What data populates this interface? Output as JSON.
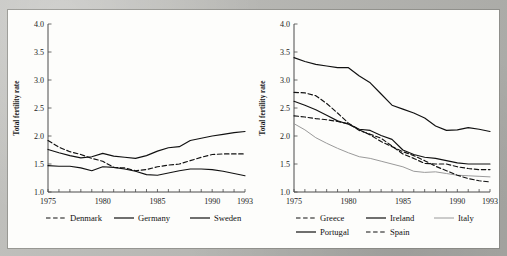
{
  "figure": {
    "background_color": "#b8b8b4",
    "panel_color": "#fdfdfb",
    "ink_color": "#1a1a1a"
  },
  "chart_data": [
    {
      "id": "northern-europe",
      "type": "line",
      "title": "",
      "xlabel": "",
      "ylabel": "Total fertility rate",
      "xlim": [
        1975,
        1993
      ],
      "ylim": [
        1.0,
        4.0
      ],
      "yticks": [
        "1.0",
        "1.5",
        "2.0",
        "2.5",
        "3.0",
        "3.5",
        "4.0"
      ],
      "ytick_values": [
        1.0,
        1.5,
        2.0,
        2.5,
        3.0,
        3.5,
        4.0
      ],
      "xticks": [
        "1975",
        "1980",
        "1985",
        "1990",
        "1993"
      ],
      "xtick_values": [
        1975,
        1980,
        1985,
        1990,
        1993
      ],
      "minor_xticks_every": 1,
      "grid": false,
      "legend_position": "below",
      "x": [
        1975,
        1976,
        1977,
        1978,
        1979,
        1980,
        1981,
        1982,
        1983,
        1984,
        1985,
        1986,
        1987,
        1988,
        1989,
        1990,
        1991,
        1992,
        1993
      ],
      "series": [
        {
          "name": "Denmark",
          "style": "dashed",
          "color": "#111111",
          "values": [
            1.92,
            1.8,
            1.72,
            1.67,
            1.6,
            1.55,
            1.44,
            1.43,
            1.38,
            1.4,
            1.45,
            1.48,
            1.5,
            1.56,
            1.62,
            1.67,
            1.68,
            1.68,
            1.68
          ]
        },
        {
          "name": "Germany",
          "style": "solid",
          "color": "#111111",
          "values": [
            1.47,
            1.46,
            1.46,
            1.43,
            1.38,
            1.45,
            1.44,
            1.41,
            1.37,
            1.31,
            1.3,
            1.34,
            1.38,
            1.41,
            1.41,
            1.4,
            1.37,
            1.33,
            1.29
          ]
        },
        {
          "name": "Sweden",
          "style": "solid",
          "color": "#111111",
          "values": [
            1.76,
            1.7,
            1.65,
            1.61,
            1.63,
            1.69,
            1.64,
            1.62,
            1.6,
            1.65,
            1.73,
            1.79,
            1.81,
            1.92,
            1.96,
            2.0,
            2.03,
            2.06,
            2.08
          ]
        }
      ]
    },
    {
      "id": "southern-europe",
      "type": "line",
      "title": "",
      "xlabel": "",
      "ylabel": "Total fertility rate",
      "xlim": [
        1975,
        1993
      ],
      "ylim": [
        1.0,
        4.0
      ],
      "yticks": [
        "1.0",
        "1.5",
        "2.0",
        "2.5",
        "3.0",
        "3.5",
        "4.0"
      ],
      "ytick_values": [
        1.0,
        1.5,
        2.0,
        2.5,
        3.0,
        3.5,
        4.0
      ],
      "xticks": [
        "1975",
        "1980",
        "1985",
        "1990",
        "1993"
      ],
      "xtick_values": [
        1975,
        1980,
        1985,
        1990,
        1993
      ],
      "minor_xticks_every": 1,
      "grid": false,
      "legend_position": "below",
      "x": [
        1975,
        1976,
        1977,
        1978,
        1979,
        1980,
        1981,
        1982,
        1983,
        1984,
        1985,
        1986,
        1987,
        1988,
        1989,
        1990,
        1991,
        1992,
        1993
      ],
      "series": [
        {
          "name": "Greece",
          "style": "dashed",
          "color": "#111111",
          "values": [
            2.36,
            2.34,
            2.31,
            2.29,
            2.26,
            2.22,
            2.1,
            2.03,
            1.96,
            1.82,
            1.68,
            1.6,
            1.51,
            1.5,
            1.5,
            1.45,
            1.42,
            1.4,
            1.4
          ]
        },
        {
          "name": "Ireland",
          "style": "solid",
          "color": "#111111",
          "values": [
            3.4,
            3.33,
            3.28,
            3.25,
            3.22,
            3.22,
            3.07,
            2.95,
            2.75,
            2.55,
            2.48,
            2.41,
            2.32,
            2.18,
            2.1,
            2.11,
            2.15,
            2.12,
            2.08
          ]
        },
        {
          "name": "Italy",
          "style": "solid",
          "color": "#9a9a9a",
          "values": [
            2.22,
            2.11,
            1.97,
            1.87,
            1.78,
            1.7,
            1.63,
            1.6,
            1.55,
            1.5,
            1.45,
            1.37,
            1.35,
            1.36,
            1.33,
            1.3,
            1.29,
            1.28,
            1.27
          ]
        },
        {
          "name": "Portugal",
          "style": "solid",
          "color": "#111111",
          "values": [
            2.62,
            2.55,
            2.47,
            2.37,
            2.27,
            2.21,
            2.12,
            2.1,
            2.01,
            1.94,
            1.75,
            1.67,
            1.62,
            1.6,
            1.56,
            1.52,
            1.5,
            1.5,
            1.5
          ]
        },
        {
          "name": "Spain",
          "style": "dashed",
          "color": "#111111",
          "values": [
            2.78,
            2.77,
            2.72,
            2.58,
            2.41,
            2.23,
            2.11,
            2.02,
            1.9,
            1.81,
            1.72,
            1.65,
            1.56,
            1.46,
            1.38,
            1.3,
            1.24,
            1.2,
            1.18
          ]
        }
      ]
    }
  ]
}
